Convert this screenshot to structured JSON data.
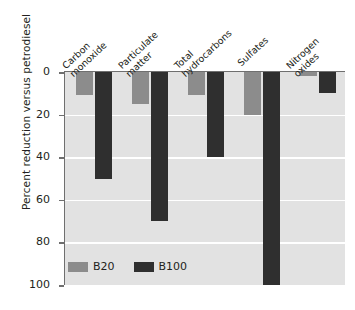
{
  "chart_data": {
    "type": "bar",
    "title": "",
    "xlabel": "",
    "ylabel": "Percent reduction versus petrodiesel",
    "ylim": [
      0,
      100
    ],
    "y_inverted": true,
    "grid": true,
    "legend_position": "bottom-left",
    "categories": [
      "Carbon monoxide",
      "Particulate matter",
      "Total hydrocarbons",
      "Sulfates",
      "Nitrogen oxides"
    ],
    "category_lines": [
      [
        "Carbon",
        "monoxide"
      ],
      [
        "Particulate",
        "matter"
      ],
      [
        "Total",
        "hydrocarbons"
      ],
      [
        "Sulfates",
        ""
      ],
      [
        "Nitrogen",
        "oxides"
      ]
    ],
    "yticks": [
      0,
      20,
      40,
      60,
      80,
      100
    ],
    "ytick_labels": [
      "0",
      "20",
      "40",
      "60",
      "80",
      "100"
    ],
    "series": [
      {
        "name": "B20",
        "color": "#8c8c8c",
        "values": [
          11,
          15,
          11,
          20,
          2
        ]
      },
      {
        "name": "B100",
        "color": "#2f2f2f",
        "values": [
          50,
          70,
          40,
          100,
          10
        ]
      }
    ]
  },
  "legend": {
    "entries": [
      {
        "label": "B20"
      },
      {
        "label": "B100"
      }
    ]
  },
  "colors": {
    "b20": "#8c8c8c",
    "b100": "#2f2f2f",
    "plot_background": "#e2e2e2",
    "gridline": "#ffffff",
    "axis": "#6f6f6f",
    "text": "#231f20"
  }
}
